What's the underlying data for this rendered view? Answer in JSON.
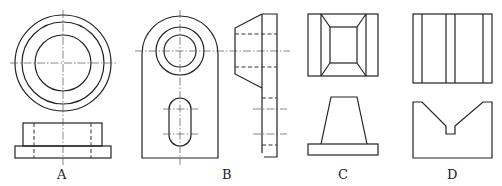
{
  "figure": {
    "type": "orthographic-projection-options",
    "options": [
      {
        "label": "A",
        "views": [
          "top-view: three concentric circles",
          "front-view: stepped flange with hidden bore lines"
        ]
      },
      {
        "label": "B",
        "views": [
          "front-view: rounded plate with counterbored hole and slotted hole",
          "side-view: tapered boss on plate with hidden lines"
        ]
      },
      {
        "label": "C",
        "views": [
          "top-view: frustum on square base",
          "front-view: trapezoid on rectangular base"
        ]
      },
      {
        "label": "D",
        "views": [
          "top-view: rectangle with vertical lines",
          "front-view: V-groove block"
        ]
      }
    ]
  },
  "labels": {
    "a": "A",
    "b": "B",
    "c": "C",
    "d": "D"
  },
  "colors": {
    "line": "#222222",
    "background": "#ffffff"
  }
}
